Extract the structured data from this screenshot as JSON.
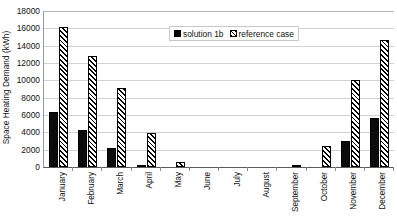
{
  "chart_data": {
    "type": "bar",
    "title": "",
    "xlabel": "",
    "ylabel": "Space Heating Demand (kWh)",
    "ylim": [
      0,
      18000
    ],
    "ytick_step": 2000,
    "yticks": [
      18000,
      16000,
      14000,
      12000,
      10000,
      8000,
      6000,
      4000,
      2000,
      0
    ],
    "ytick_labels": [
      "18000",
      "16000",
      "14000",
      "12000",
      "10000",
      "8000",
      "6000",
      "4000",
      "2000",
      "0"
    ],
    "grid": true,
    "legend_position": "top-center",
    "categories": [
      "January",
      "February",
      "March",
      "April",
      "May",
      "June",
      "July",
      "August",
      "September",
      "October",
      "November",
      "December"
    ],
    "series": [
      {
        "name": "solution 1b",
        "style": "solid-black",
        "color": "#000000",
        "values": [
          6400,
          4300,
          2200,
          250,
          0,
          0,
          0,
          0,
          0,
          0,
          3000,
          5600
        ]
      },
      {
        "name": "reference case",
        "style": "hatched",
        "color": "#000000",
        "values": [
          16100,
          12800,
          9100,
          3900,
          600,
          0,
          0,
          0,
          250,
          2400,
          10000,
          14700
        ]
      }
    ]
  },
  "legend": {
    "entries": [
      {
        "label": "solution 1b",
        "swatch": "solid-square-icon"
      },
      {
        "label": "reference case",
        "swatch": "hatched-square-icon"
      }
    ]
  }
}
